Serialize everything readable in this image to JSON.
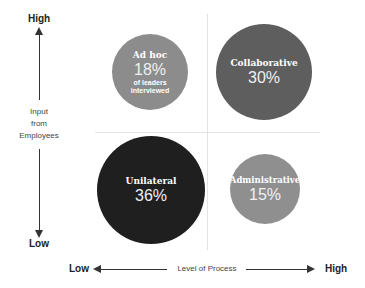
{
  "y_axis": {
    "high_label": "High",
    "low_label": "Low",
    "title_line1": "Input",
    "title_line2": "from",
    "title_line3": "Employees"
  },
  "x_axis": {
    "low_label": "Low",
    "high_label": "High",
    "title": "Level of Process"
  },
  "quadrants": [
    {
      "name": "Ad hoc",
      "percent": "18%",
      "subtitle_line1": "of leaders",
      "subtitle_line2": "interviewed",
      "position": "top-left",
      "color": "#8c8c8c"
    },
    {
      "name": "Collaborative",
      "percent": "30%",
      "position": "top-right",
      "color": "#5e5e5e"
    },
    {
      "name": "Unilateral",
      "percent": "36%",
      "position": "bottom-left",
      "color": "#1f1f1f"
    },
    {
      "name": "Administrative",
      "percent": "15%",
      "position": "bottom-right",
      "color": "#8f8f8f"
    }
  ]
}
